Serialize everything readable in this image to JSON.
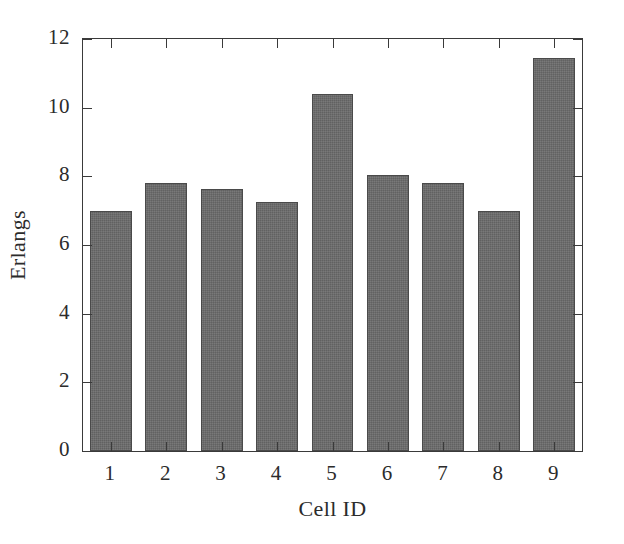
{
  "chart_data": {
    "type": "bar",
    "title": "",
    "subtitle": "",
    "xlabel": "Cell ID",
    "ylabel": "Erlangs",
    "categories": [
      "1",
      "2",
      "3",
      "4",
      "5",
      "6",
      "7",
      "8",
      "9"
    ],
    "values": [
      7.0,
      7.82,
      7.63,
      7.25,
      10.4,
      8.04,
      7.8,
      7.0,
      11.45
    ],
    "series": [
      {
        "name": "Erlangs",
        "values": [
          7.0,
          7.82,
          7.63,
          7.25,
          10.4,
          8.04,
          7.8,
          7.0,
          11.45
        ]
      }
    ],
    "ylim": [
      0,
      12
    ],
    "xlim": [
      0.5,
      9.5
    ],
    "yticks": [
      0,
      2,
      4,
      6,
      8,
      10,
      12
    ],
    "ytick_labels": [
      "0",
      "2",
      "4",
      "6",
      "8",
      "10",
      "12"
    ],
    "xtick_labels": [
      "1",
      "2",
      "3",
      "4",
      "5",
      "6",
      "7",
      "8",
      "9"
    ],
    "grid": false,
    "legend": null,
    "legend_position": "none",
    "bar_color": "#6b6b6b",
    "bar_edge_color": "#4a4a4a",
    "axis_color": "#3a3a3a",
    "background_color": "#ffffff",
    "annotations": []
  }
}
